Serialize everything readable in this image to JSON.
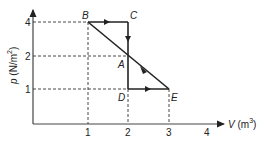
{
  "diagram": {
    "type": "p-V cycle",
    "axes": {
      "x": {
        "label_var": "V",
        "label_unit": "(m",
        "label_sup": "3",
        "label_close": ")",
        "ticks": [
          "1",
          "2",
          "3",
          "4"
        ]
      },
      "y": {
        "label_var": "p",
        "label_unit": "(N/m",
        "label_sup": "2",
        "label_close": ")",
        "ticks": [
          "1",
          "2",
          "4"
        ]
      }
    },
    "points": {
      "A": {
        "label": "A",
        "V": 2,
        "p": 2
      },
      "B": {
        "label": "B",
        "V": 1,
        "p": 4
      },
      "C": {
        "label": "C",
        "V": 2,
        "p": 4
      },
      "D": {
        "label": "D",
        "V": 2,
        "p": 1
      },
      "E": {
        "label": "E",
        "V": 3,
        "p": 1
      }
    },
    "path_segments": [
      {
        "from": "B",
        "to": "C",
        "direction": "right"
      },
      {
        "from": "C",
        "to": "A",
        "direction": "down"
      },
      {
        "from": "A",
        "to": "D",
        "direction": "down"
      },
      {
        "from": "D",
        "to": "E",
        "direction": "right"
      },
      {
        "from": "E",
        "to": "A",
        "direction": "up-left"
      },
      {
        "from": "A",
        "to": "B",
        "direction": "up-left"
      }
    ],
    "colors": {
      "line": "#222222",
      "dashed": "#333333",
      "background": "#ffffff"
    }
  }
}
